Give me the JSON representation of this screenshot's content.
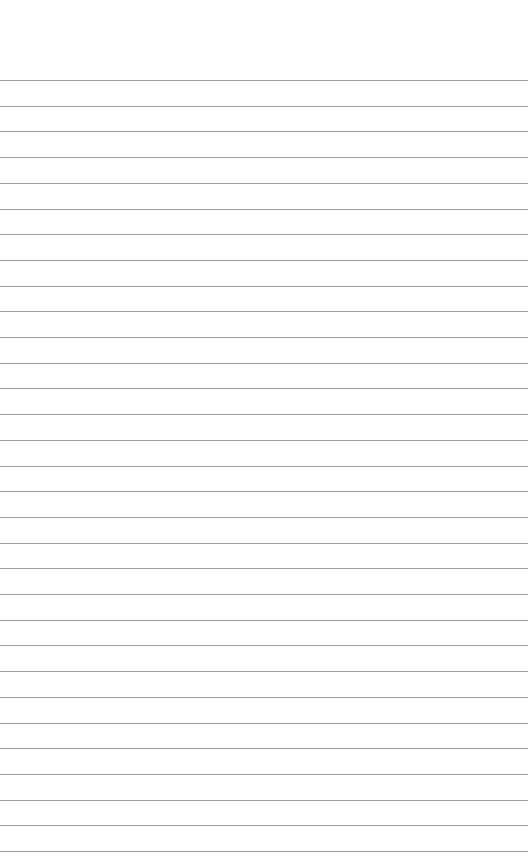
{
  "paper": {
    "type": "lined-notepad",
    "background_color": "#ffffff",
    "line_color": "#8e8e8e",
    "first_line_y": 80,
    "line_spacing": 25.7,
    "line_count": 31,
    "text": ""
  }
}
